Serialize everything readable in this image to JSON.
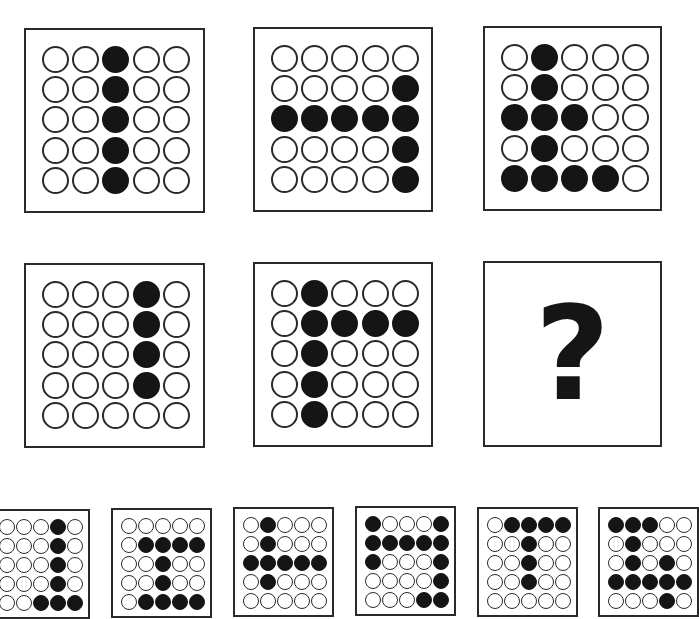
{
  "puzzle": {
    "matrix": [
      {
        "id": "cell-1",
        "rows": [
          "00100",
          "00100",
          "00100",
          "00100",
          "00100"
        ]
      },
      {
        "id": "cell-2",
        "rows": [
          "00000",
          "00001",
          "11111",
          "00001",
          "00001"
        ]
      },
      {
        "id": "cell-3",
        "rows": [
          "01000",
          "01000",
          "11100",
          "01000",
          "11110"
        ]
      },
      {
        "id": "cell-4",
        "rows": [
          "00010",
          "00010",
          "00010",
          "00010",
          "00000"
        ]
      },
      {
        "id": "cell-5",
        "rows": [
          "01000",
          "01111",
          "01000",
          "01000",
          "01000"
        ]
      },
      {
        "id": "cell-6",
        "missing": true,
        "symbol": "?"
      }
    ],
    "options": [
      {
        "id": "option-1",
        "rows": [
          "00010",
          "00010",
          "00010",
          "00010",
          "00111"
        ]
      },
      {
        "id": "option-2",
        "rows": [
          "00000",
          "01111",
          "00100",
          "00100",
          "01111"
        ]
      },
      {
        "id": "option-3",
        "rows": [
          "01000",
          "01000",
          "11111",
          "01000",
          "00000"
        ]
      },
      {
        "id": "option-4",
        "rows": [
          "10001",
          "11111",
          "10001",
          "00001",
          "00011"
        ]
      },
      {
        "id": "option-5",
        "rows": [
          "01111",
          "00100",
          "00100",
          "00100",
          "00000"
        ]
      },
      {
        "id": "option-6",
        "rows": [
          "11100",
          "01000",
          "01010",
          "11111",
          "00010"
        ]
      }
    ]
  },
  "colors": {
    "filled": "#151515",
    "outline": "#2a2a2a",
    "background": "#ffffff"
  }
}
